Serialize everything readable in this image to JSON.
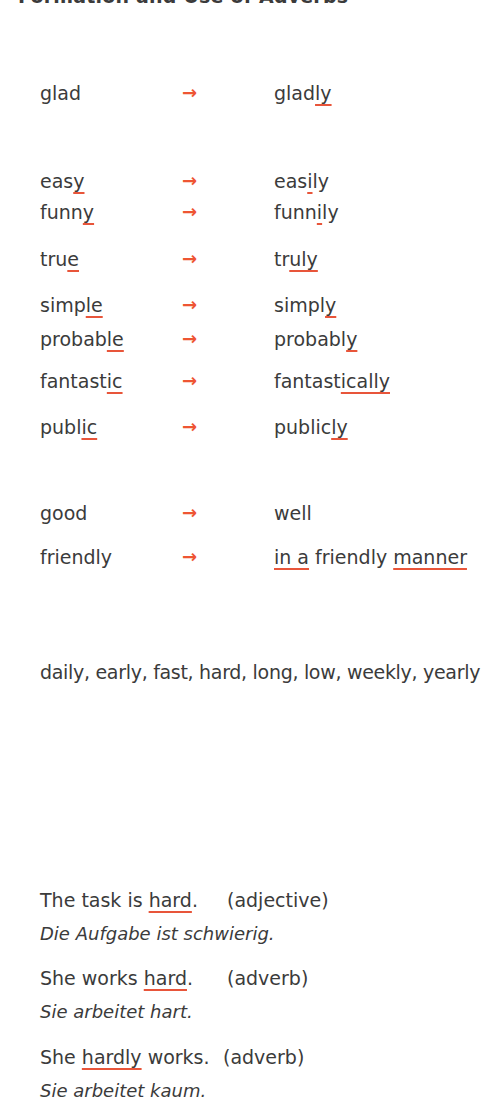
{
  "title": "Formation and Use of Adverbs",
  "colors": {
    "text": "#3b3b3b",
    "accent": "#ee5533"
  },
  "arrow_glyph": "→",
  "groups": [
    {
      "rows": [
        {
          "adjective": {
            "pre": "glad",
            "u": "",
            "post": ""
          },
          "adverb": {
            "pre": "glad",
            "u": "ly",
            "post": ""
          }
        }
      ]
    },
    {
      "rows": [
        {
          "adjective": {
            "pre": "eas",
            "u": "y",
            "post": ""
          },
          "adverb": {
            "pre": "eas",
            "u": "i",
            "post": "ly"
          }
        },
        {
          "adjective": {
            "pre": "funn",
            "u": "y",
            "post": ""
          },
          "adverb": {
            "pre": "funn",
            "u": "i",
            "post": "ly"
          }
        },
        {
          "adjective": {
            "pre": "tru",
            "u": "e",
            "post": ""
          },
          "adverb": {
            "pre": "tr",
            "u": "uly",
            "post": ""
          }
        },
        {
          "adjective": {
            "pre": "simp",
            "u": "le",
            "post": ""
          },
          "adverb": {
            "pre": "simpl",
            "u": "y",
            "post": ""
          }
        },
        {
          "adjective": {
            "pre": "probab",
            "u": "le",
            "post": ""
          },
          "adverb": {
            "pre": "probabl",
            "u": "y",
            "post": ""
          }
        },
        {
          "adjective": {
            "pre": "fantast",
            "u": "ic",
            "post": ""
          },
          "adverb": {
            "pre": "fantast",
            "u": "ically",
            "post": ""
          }
        },
        {
          "adjective": {
            "pre": "publ",
            "u": "ic",
            "post": ""
          },
          "adverb": {
            "pre": "public",
            "u": "ly",
            "post": ""
          }
        }
      ]
    },
    {
      "rows": [
        {
          "adjective": {
            "pre": "good",
            "u": "",
            "post": ""
          },
          "adverb": {
            "pre": "well",
            "u": "",
            "post": ""
          }
        },
        {
          "adjective": {
            "pre": "friendly",
            "u": "",
            "post": ""
          },
          "adverb": {
            "u1": "in a",
            "mid": " friendly ",
            "u2": "manner"
          }
        }
      ]
    }
  ],
  "same_form_list": "daily, early, fast, hard, long, low, weekly, yearly",
  "examples": [
    {
      "pre": "The task is ",
      "u": "hard",
      "post": ".",
      "label": "(adjective)",
      "translation": "Die Aufgabe ist schwierig."
    },
    {
      "pre": "She works ",
      "u": "hard",
      "post": ".",
      "label": "(adverb)",
      "translation": "Sie arbeitet hart."
    },
    {
      "pre": "She ",
      "u": "hardly",
      "post": " works.",
      "label": "(adverb)",
      "translation": "Sie arbeitet kaum."
    }
  ]
}
